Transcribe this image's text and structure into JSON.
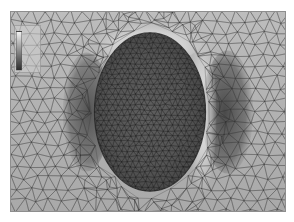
{
  "figure": {
    "caption_remnant": "",
    "panel_label": "mesh-plot-panel",
    "background_color": "#b4b4b4",
    "frame_color": "#8e8e8e"
  },
  "legend": {
    "title": "",
    "ticks": [
      "",
      "",
      "",
      "",
      "",
      "",
      ""
    ],
    "gradient_low": "#2c2c2c",
    "gradient_high": "#f2f2f2"
  },
  "chart_data": {
    "type": "heatmap",
    "title": "",
    "subtitle": "",
    "xlabel": "",
    "ylabel": "",
    "xlim": [
      0,
      276
    ],
    "ylim": [
      0,
      201
    ],
    "grid": false,
    "legend_position": "top-left-inset",
    "colormap": "grayscale",
    "features": [
      {
        "name": "outer-domain",
        "shape": "rectangle",
        "x": 0,
        "y": 0,
        "width": 276,
        "height": 201,
        "mesh_density": "coarse",
        "mean_gray": 0.7
      },
      {
        "name": "central-inclusion",
        "shape": "ellipse",
        "cx": 140,
        "cy": 101,
        "rx": 56,
        "ry": 80,
        "mesh_density": "fine",
        "mean_gray": 0.42
      },
      {
        "name": "left-dark-lobe",
        "shape": "lens",
        "cx": 76,
        "cy": 101,
        "rx": 22,
        "ry": 58,
        "mean_gray": 0.38
      },
      {
        "name": "right-dark-lobe",
        "shape": "lens",
        "cx": 216,
        "cy": 101,
        "rx": 24,
        "ry": 60,
        "mean_gray": 0.36
      },
      {
        "name": "top-bright-arc",
        "shape": "arc",
        "cx": 140,
        "cy": 30,
        "rx": 46,
        "ry": 18,
        "mean_gray": 0.92
      },
      {
        "name": "right-bright-band",
        "shape": "band",
        "cx": 192,
        "cy": 104,
        "rx": 12,
        "ry": 76,
        "mean_gray": 0.9
      }
    ],
    "gray_scale_stops": [
      {
        "value": 0.0,
        "color": "#2c2c2c"
      },
      {
        "value": 0.25,
        "color": "#5a5a5a"
      },
      {
        "value": 0.5,
        "color": "#8c8c8c"
      },
      {
        "value": 0.75,
        "color": "#bdbdbd"
      },
      {
        "value": 1.0,
        "color": "#f2f2f2"
      }
    ],
    "mesh_stats": {
      "interior_edge_length_px": 6,
      "exterior_edge_length_px": 13,
      "edge_color": "#303030"
    }
  }
}
